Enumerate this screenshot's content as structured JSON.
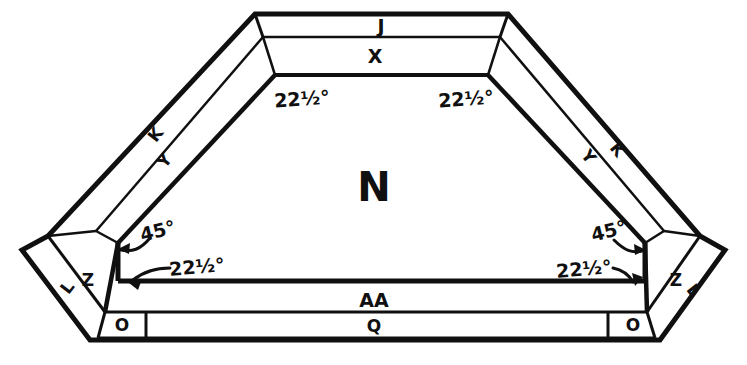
{
  "diagram": {
    "background_color": "#ffffff",
    "line_color": "#101010",
    "center_label": "N",
    "parts": [
      {
        "id": "part-j",
        "label": "J",
        "x": 381,
        "y": 27,
        "size": "part",
        "note": "top outer narrow band"
      },
      {
        "id": "part-x",
        "label": "X",
        "x": 375,
        "y": 57,
        "size": "part",
        "note": "top inner wide band"
      },
      {
        "id": "part-k-left",
        "label": "K",
        "x": 156,
        "y": 135,
        "rotate": -52,
        "size": "part-sm",
        "note": "left outer diagonal band"
      },
      {
        "id": "part-y-left",
        "label": "Y",
        "x": 165,
        "y": 161,
        "rotate": -52,
        "size": "part-sm",
        "note": "left inner diagonal band"
      },
      {
        "id": "part-y-right",
        "label": "Y",
        "x": 588,
        "y": 157,
        "rotate": 52,
        "size": "part-sm",
        "note": "right inner diagonal band"
      },
      {
        "id": "part-k-right",
        "label": "K",
        "x": 617,
        "y": 150,
        "rotate": 52,
        "size": "part-sm",
        "note": "right outer diagonal band"
      },
      {
        "id": "part-z-left",
        "label": "Z",
        "x": 88,
        "y": 281,
        "size": "part-sm",
        "note": "left corner inner wedge"
      },
      {
        "id": "part-l-left",
        "label": "L",
        "x": 68,
        "y": 288,
        "rotate": -52,
        "size": "part-sm",
        "note": "left corner outer wedge"
      },
      {
        "id": "part-z-right",
        "label": "Z",
        "x": 676,
        "y": 281,
        "size": "part-sm",
        "note": "right corner inner wedge"
      },
      {
        "id": "part-l-right",
        "label": "L",
        "x": 693,
        "y": 291,
        "rotate": 52,
        "size": "part-sm",
        "note": "right corner outer wedge"
      },
      {
        "id": "part-aa",
        "label": "AA",
        "x": 374,
        "y": 301,
        "size": "part",
        "note": "bottom wide band"
      },
      {
        "id": "part-q",
        "label": "Q",
        "x": 374,
        "y": 328,
        "size": "part-sm",
        "note": "bottom thin strip"
      },
      {
        "id": "part-o-left",
        "label": "O",
        "x": 120,
        "y": 327,
        "size": "part-sm",
        "note": "bottom-left small block"
      },
      {
        "id": "part-o-right",
        "label": "O",
        "x": 633,
        "y": 327,
        "size": "part-sm",
        "note": "bottom-right small block"
      }
    ],
    "angles": [
      {
        "id": "angle-top-left",
        "value": "22",
        "fraction": "1/2",
        "unit": "°",
        "text": "22½°",
        "x": 302,
        "y": 100,
        "arrow": false
      },
      {
        "id": "angle-top-right",
        "value": "22",
        "fraction": "1/2",
        "unit": "°",
        "text": "22½°",
        "x": 465,
        "y": 100,
        "arrow": false
      },
      {
        "id": "angle-left-45",
        "value": "45",
        "fraction": "",
        "unit": "°",
        "text": "45°",
        "x": 155,
        "y": 234,
        "arrow": true
      },
      {
        "id": "angle-left-22half",
        "value": "22",
        "fraction": "1/2",
        "unit": "°",
        "text": "22½°",
        "x": 196,
        "y": 269,
        "arrow": true
      },
      {
        "id": "angle-right-45",
        "value": "45",
        "fraction": "",
        "unit": "°",
        "text": "45°",
        "x": 608,
        "y": 234,
        "arrow": true
      },
      {
        "id": "angle-right-22half",
        "value": "22",
        "fraction": "1/2",
        "unit": "°",
        "text": "22½°",
        "x": 586,
        "y": 272,
        "arrow": true
      }
    ]
  }
}
